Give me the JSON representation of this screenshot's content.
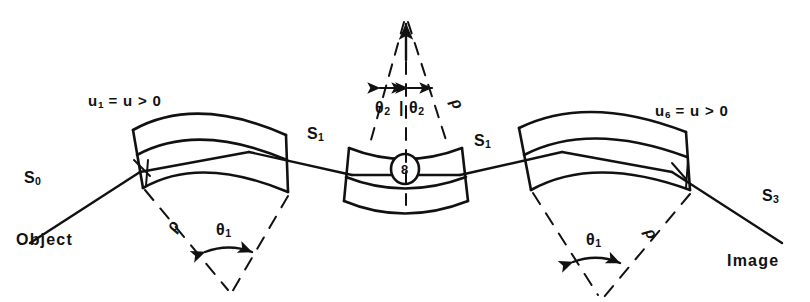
{
  "figure": {
    "type": "optical-ray-diagram",
    "title": "",
    "background_color": "#ffffff",
    "ink_color": "#111111"
  },
  "labels": {
    "object": "Object",
    "image": "Image",
    "surface_s0": "S",
    "surface_s0_sub": "0",
    "surface_s1_left": "S",
    "surface_s1_left_sub": "1",
    "surface_s1_right": "S",
    "surface_s1_right_sub": "1",
    "surface_s3": "S",
    "surface_s3_sub": "3",
    "aperture_left_u": "u",
    "aperture_left_sub": "1",
    "aperture_left_rest": " = u > 0",
    "aperture_right_u": "u",
    "aperture_right_sub": "6",
    "aperture_right_rest": " = u > 0",
    "theta1_left": "θ",
    "theta1_left_sub": "1",
    "theta1_right": "θ",
    "theta1_right_sub": "1",
    "theta2_left": "θ",
    "theta2_left_sub": "2",
    "theta2_right": "θ",
    "theta2_right_sub": "2",
    "theta2_separator": "|",
    "rho_left": "ρ",
    "rho_center": "ρ",
    "rho_right": "ρ",
    "stop_marker": "8"
  },
  "icons": {
    "arrow_up": "arrow-up-icon",
    "double_arrow_left": "double-arrow-icon",
    "double_arrow_right": "double-arrow-icon",
    "angle_arc_left": "angle-arc-icon",
    "angle_arc_right": "angle-arc-icon",
    "stop_circle": "circled-stop-icon"
  },
  "geometry": {
    "elements": [
      {
        "name": "lens-element-left",
        "orientation": "concave-down",
        "center_x": 195,
        "center_y": 155
      },
      {
        "name": "lens-element-center",
        "orientation": "concave-up",
        "center_x": 405,
        "center_y": 170
      },
      {
        "name": "lens-element-right",
        "orientation": "concave-down",
        "center_x": 610,
        "center_y": 155
      }
    ],
    "ray_path": "object-to-image",
    "angles": {
      "theta1_deg": 22,
      "theta2_deg": 14
    }
  }
}
